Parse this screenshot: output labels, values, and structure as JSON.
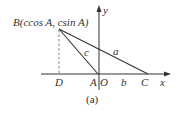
{
  "figure": {
    "caption": "(a)",
    "point_B_label": "B(ccos A, csin A)",
    "axis_x_label": "x",
    "axis_y_label": "y",
    "points": {
      "D": "D",
      "A": "A",
      "O": "O",
      "C": "C"
    },
    "sides": {
      "a": "a",
      "b": "b",
      "c": "c"
    },
    "colors": {
      "line": "#333333",
      "dashed": "#666666",
      "background": "#ffffff"
    }
  }
}
